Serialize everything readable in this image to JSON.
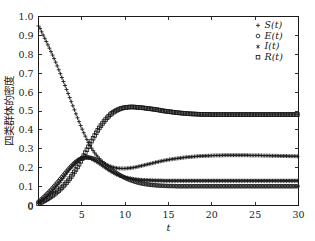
{
  "chart_data": {
    "type": "line",
    "title": "",
    "xlabel": "t",
    "ylabel": "四类群体的密度",
    "xlim": [
      0,
      30
    ],
    "ylim": [
      0,
      1.0
    ],
    "xticks": [
      0,
      5,
      10,
      15,
      20,
      25,
      30
    ],
    "xtick_labels": [
      "0",
      "5",
      "10",
      "15",
      "20",
      "25",
      "30"
    ],
    "yticks": [
      0,
      0.1,
      0.2,
      0.3,
      0.4,
      0.5,
      0.6,
      0.7,
      0.8,
      0.9,
      1.0
    ],
    "ytick_labels": [
      "0",
      "0.1",
      "0.2",
      "0.3",
      "0.4",
      "0.5",
      "0.6",
      "0.7",
      "0.8",
      "0.9",
      "1.0"
    ],
    "grid": false,
    "legend_position": "top-right",
    "color": "#1a1a1a",
    "x": [
      0,
      0.5,
      1,
      1.5,
      2,
      2.5,
      3,
      3.5,
      4,
      4.5,
      5,
      5.5,
      6,
      6.5,
      7,
      7.5,
      8,
      8.5,
      9,
      9.5,
      10,
      10.5,
      11,
      11.5,
      12,
      12.5,
      13,
      13.5,
      14,
      14.5,
      15,
      15.5,
      16,
      16.5,
      17,
      17.5,
      18,
      18.5,
      19,
      19.5,
      20,
      20.5,
      21,
      21.5,
      22,
      22.5,
      23,
      23.5,
      24,
      24.5,
      25,
      25.5,
      26,
      26.5,
      27,
      27.5,
      28,
      28.5,
      29,
      29.5,
      30
    ],
    "series": [
      {
        "name": "S(t)",
        "marker": "plus",
        "legend_label": "S(t)",
        "values": [
          0.95,
          0.905,
          0.858,
          0.808,
          0.756,
          0.7,
          0.642,
          0.583,
          0.523,
          0.464,
          0.408,
          0.357,
          0.313,
          0.277,
          0.249,
          0.228,
          0.213,
          0.204,
          0.198,
          0.196,
          0.196,
          0.198,
          0.201,
          0.206,
          0.211,
          0.217,
          0.222,
          0.228,
          0.233,
          0.238,
          0.242,
          0.246,
          0.249,
          0.252,
          0.255,
          0.257,
          0.259,
          0.261,
          0.262,
          0.263,
          0.264,
          0.265,
          0.265,
          0.266,
          0.266,
          0.266,
          0.266,
          0.266,
          0.266,
          0.265,
          0.265,
          0.265,
          0.264,
          0.264,
          0.263,
          0.263,
          0.262,
          0.262,
          0.261,
          0.261,
          0.26
        ]
      },
      {
        "name": "E(t)",
        "marker": "circle",
        "legend_label": "E(t)",
        "values": [
          0.02,
          0.04,
          0.062,
          0.086,
          0.112,
          0.139,
          0.167,
          0.194,
          0.218,
          0.237,
          0.249,
          0.254,
          0.252,
          0.245,
          0.233,
          0.219,
          0.203,
          0.187,
          0.172,
          0.158,
          0.146,
          0.136,
          0.128,
          0.121,
          0.116,
          0.112,
          0.109,
          0.107,
          0.105,
          0.104,
          0.103,
          0.103,
          0.102,
          0.102,
          0.102,
          0.102,
          0.102,
          0.102,
          0.102,
          0.102,
          0.102,
          0.102,
          0.102,
          0.102,
          0.102,
          0.102,
          0.102,
          0.102,
          0.102,
          0.102,
          0.102,
          0.102,
          0.102,
          0.102,
          0.102,
          0.102,
          0.102,
          0.102,
          0.102,
          0.102,
          0.102
        ]
      },
      {
        "name": "I(t)",
        "marker": "asterisk",
        "legend_label": "I(t)",
        "values": [
          0.015,
          0.031,
          0.05,
          0.072,
          0.097,
          0.125,
          0.155,
          0.186,
          0.214,
          0.238,
          0.253,
          0.256,
          0.25,
          0.238,
          0.223,
          0.207,
          0.191,
          0.177,
          0.165,
          0.156,
          0.149,
          0.144,
          0.14,
          0.137,
          0.135,
          0.134,
          0.133,
          0.132,
          0.132,
          0.131,
          0.131,
          0.131,
          0.131,
          0.131,
          0.131,
          0.131,
          0.131,
          0.131,
          0.131,
          0.131,
          0.131,
          0.131,
          0.131,
          0.131,
          0.131,
          0.131,
          0.131,
          0.131,
          0.131,
          0.131,
          0.131,
          0.131,
          0.131,
          0.131,
          0.131,
          0.131,
          0.131,
          0.131,
          0.131,
          0.131,
          0.131
        ]
      },
      {
        "name": "R(t)",
        "marker": "square",
        "legend_label": "R(t)",
        "values": [
          0.01,
          0.021,
          0.034,
          0.049,
          0.066,
          0.086,
          0.109,
          0.136,
          0.168,
          0.204,
          0.245,
          0.288,
          0.331,
          0.372,
          0.409,
          0.441,
          0.468,
          0.489,
          0.503,
          0.513,
          0.518,
          0.521,
          0.521,
          0.519,
          0.517,
          0.514,
          0.511,
          0.508,
          0.504,
          0.5,
          0.497,
          0.494,
          0.491,
          0.489,
          0.487,
          0.485,
          0.484,
          0.483,
          0.482,
          0.482,
          0.481,
          0.481,
          0.481,
          0.481,
          0.481,
          0.481,
          0.481,
          0.481,
          0.481,
          0.481,
          0.481,
          0.481,
          0.481,
          0.481,
          0.481,
          0.481,
          0.481,
          0.481,
          0.481,
          0.481,
          0.481
        ]
      }
    ]
  }
}
